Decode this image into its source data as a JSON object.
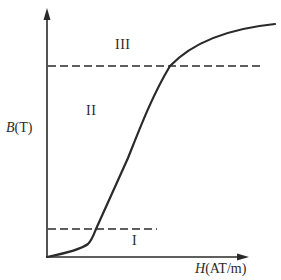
{
  "diagram": {
    "y_axis": {
      "symbol": "B",
      "unit": "(T)"
    },
    "x_axis": {
      "symbol": "H",
      "unit": "(AT/m)"
    },
    "regions": [
      {
        "id": "I",
        "label": "I"
      },
      {
        "id": "II",
        "label": "II"
      },
      {
        "id": "III",
        "label": "III"
      }
    ],
    "colors": {
      "line": "#2a2a2a",
      "background": "#ffffff"
    }
  }
}
